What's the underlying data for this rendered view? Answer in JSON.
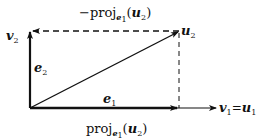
{
  "diagram": {
    "labels": {
      "v2": {
        "main": "v",
        "sub": "2"
      },
      "u2": {
        "main": "u",
        "sub": "2"
      },
      "e2": {
        "main": "e",
        "sub": "2"
      },
      "e1": {
        "main": "e",
        "sub": "1"
      },
      "v1_eq_u1": {
        "v": "v",
        "vsub": "1",
        "eq": "=",
        "u": "u",
        "usub": "1"
      },
      "neg_proj": {
        "minus": "−",
        "proj": "proj",
        "e": "e",
        "esub": "1",
        "open": "(",
        "u": "u",
        "usub": "2",
        "close": ")"
      },
      "proj": {
        "proj": "proj",
        "e": "e",
        "esub": "1",
        "open": "(",
        "u": "u",
        "usub": "2",
        "close": ")"
      }
    },
    "vectors": [
      {
        "name": "e1",
        "style": "solid-thick"
      },
      {
        "name": "e2",
        "style": "solid-thick"
      },
      {
        "name": "v1",
        "style": "solid"
      },
      {
        "name": "u2",
        "style": "solid"
      },
      {
        "name": "neg-proj",
        "style": "dashed"
      },
      {
        "name": "projection-drop",
        "style": "dashed"
      }
    ],
    "colors": {
      "stroke": "#111111",
      "background": "#ffffff"
    }
  }
}
